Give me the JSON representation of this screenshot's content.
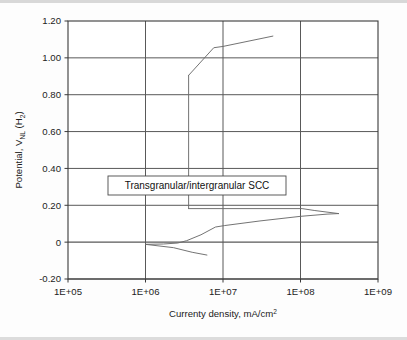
{
  "chart_data": {
    "type": "line",
    "title": "",
    "subtitle": "",
    "xlabel": "Currenty density, mA/cm²",
    "ylabel": "Potential, V",
    "ylabel_sub": "NL",
    "ylabel_tail": " (H",
    "ylabel_tail_sub": "2",
    "ylabel_tail_end": ")",
    "xscale": "log",
    "yscale": "linear",
    "xlim": [
      100000,
      1000000000
    ],
    "ylim": [
      -0.2,
      1.2
    ],
    "grid": true,
    "legend": null,
    "xticks": [
      100000,
      1000000,
      10000000,
      100000000,
      1000000000
    ],
    "xtick_labels": [
      "1E+05",
      "1E+06",
      "1E+07",
      "1E+08",
      "1E+09"
    ],
    "yticks": [
      -0.2,
      0,
      0.2,
      0.4,
      0.6,
      0.8,
      1.0,
      1.2
    ],
    "ytick_labels": [
      "-0.20",
      "0",
      "0.20",
      "0.40",
      "0.60",
      "0.80",
      "1.00",
      "1.20"
    ],
    "line_color": "#6b6b6b",
    "grid_color": "#595959",
    "axis_color": "#3a3a3a",
    "series": [
      {
        "name": "anodic-forward-branch",
        "points": [
          [
            1000000.0,
            -0.012
          ],
          [
            1700000.0,
            -0.01
          ],
          [
            2600000.0,
            -0.005
          ],
          [
            3400000.0,
            0.008
          ],
          [
            5200000.0,
            0.04
          ],
          [
            8000000.0,
            0.082
          ],
          [
            10500000.0,
            0.09
          ],
          [
            30000000.0,
            0.115
          ],
          [
            100000000.0,
            0.14
          ],
          [
            220000000.0,
            0.152
          ],
          [
            310000000.0,
            0.155
          ]
        ]
      },
      {
        "name": "reverse-scan-upper-return",
        "points": [
          [
            310000000.0,
            0.155
          ],
          [
            150000000.0,
            0.172
          ],
          [
            105000000.0,
            0.182
          ],
          [
            3600000.0,
            0.182
          ]
        ]
      },
      {
        "name": "passive-vertical-transition",
        "points": [
          [
            3600000.0,
            0.182
          ],
          [
            3600000.0,
            0.905
          ]
        ]
      },
      {
        "name": "transpassive-branch",
        "points": [
          [
            3600000.0,
            0.905
          ],
          [
            7600000.0,
            1.055
          ],
          [
            10000000.0,
            1.062
          ],
          [
            44000000.0,
            1.118
          ]
        ]
      },
      {
        "name": "cathodic-branch",
        "points": [
          [
            1000000.0,
            -0.012
          ],
          [
            2300000.0,
            -0.03
          ],
          [
            4000000.0,
            -0.055
          ],
          [
            6200000.0,
            -0.07
          ]
        ]
      }
    ],
    "annotations": [
      {
        "name": "scc-region-label",
        "text": "Transgranular/intergranular SCC",
        "x_px": 108,
        "y_px": 176,
        "w_px": 178,
        "h_px": 19
      }
    ]
  },
  "plot": {
    "left_px": 68,
    "right_px": 378,
    "top_px": 21,
    "bottom_px": 279
  }
}
